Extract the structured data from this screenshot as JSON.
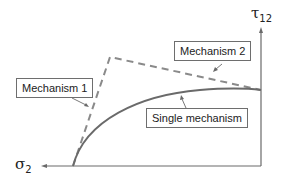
{
  "diagram": {
    "axes": {
      "vertical": {
        "symbol": "τ",
        "subscript": "12"
      },
      "horizontal": {
        "symbol": "σ",
        "subscript": "2"
      }
    },
    "labels": {
      "mechanism1": "Mechanism 1",
      "mechanism2": "Mechanism 2",
      "single": "Single mechanism"
    },
    "colors": {
      "axis": "#6a6a6a",
      "curve": "#6a6a6a",
      "dashed": "#8a8a8a",
      "box_border": "#6e6e6e",
      "text": "#222222"
    }
  }
}
